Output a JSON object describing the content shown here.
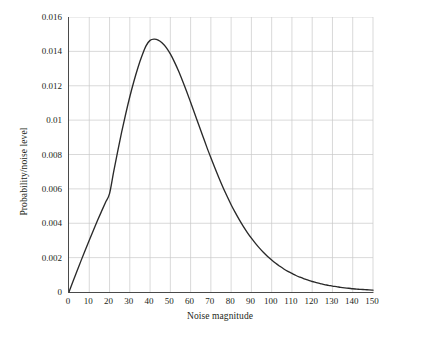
{
  "chart_data": {
    "type": "line",
    "title": "",
    "xlabel": "Noise magnitude",
    "ylabel": "Probability/noise level",
    "xlim": [
      0,
      150
    ],
    "ylim": [
      0,
      0.016
    ],
    "grid": true,
    "legend": null,
    "xticks": [
      0,
      10,
      20,
      30,
      40,
      50,
      60,
      70,
      80,
      90,
      100,
      110,
      120,
      130,
      140,
      150
    ],
    "xticklabels": [
      "0",
      "10",
      "20",
      "30",
      "40",
      "50",
      "60",
      "70",
      "80",
      "90",
      "100",
      "110",
      "120",
      "130",
      "140",
      "150"
    ],
    "yticks": [
      0,
      0.002,
      0.004,
      0.006,
      0.008,
      0.01,
      0.012,
      0.014,
      0.016
    ],
    "yticklabels": [
      "0",
      "0.002",
      "0.004",
      "0.006",
      "0.008",
      "0.01",
      "0.012",
      "0.014",
      "0.016"
    ],
    "line_color": "#2a2a2a",
    "grid_color": "#c8c8c8",
    "axis_color": "#4a4a4a",
    "peak": {
      "x": 41,
      "y": 0.0147
    },
    "series": [
      {
        "name": "Probability density",
        "x": [
          0,
          2,
          4,
          6,
          8,
          10,
          12,
          14,
          16,
          18,
          20,
          22,
          24,
          26,
          28,
          30,
          32,
          34,
          36,
          38,
          40,
          42,
          44,
          46,
          48,
          50,
          52,
          54,
          56,
          58,
          60,
          62,
          64,
          66,
          68,
          70,
          72,
          74,
          76,
          78,
          80,
          82,
          84,
          86,
          88,
          90,
          92,
          94,
          96,
          98,
          100,
          102,
          104,
          106,
          108,
          110,
          112,
          114,
          116,
          118,
          120,
          122,
          124,
          126,
          128,
          130,
          132,
          134,
          136,
          138,
          140,
          142,
          144,
          146,
          148,
          150
        ],
        "y": [
          0.0,
          0.00062,
          0.00123,
          0.00184,
          0.00243,
          0.00301,
          0.00358,
          0.00414,
          0.00468,
          0.00521,
          0.00572,
          0.00697,
          0.00817,
          0.00931,
          0.01037,
          0.01136,
          0.01225,
          0.01305,
          0.01374,
          0.01432,
          0.01464,
          0.01471,
          0.01466,
          0.01449,
          0.01422,
          0.01385,
          0.01339,
          0.01287,
          0.01229,
          0.01168,
          0.01104,
          0.01039,
          0.00973,
          0.00908,
          0.00843,
          0.00781,
          0.00721,
          0.00663,
          0.00608,
          0.00557,
          0.00508,
          0.00463,
          0.00421,
          0.00382,
          0.00346,
          0.00313,
          0.00283,
          0.00255,
          0.0023,
          0.00207,
          0.00186,
          0.00167,
          0.0015,
          0.00134,
          0.0012,
          0.00108,
          0.00096,
          0.00086,
          0.00077,
          0.00069,
          0.00061,
          0.00055,
          0.00049,
          0.00043,
          0.00039,
          0.00034,
          0.00031,
          0.00027,
          0.00024,
          0.00022,
          0.00019,
          0.00017,
          0.00015,
          0.00014,
          0.00012,
          0.00011
        ]
      }
    ]
  }
}
